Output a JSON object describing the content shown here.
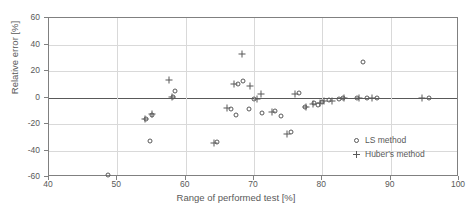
{
  "chart_data": {
    "type": "scatter",
    "title": "",
    "xlabel": "Range of performed test [%]",
    "ylabel": "Relative error [%]",
    "xlim": [
      40,
      100
    ],
    "ylim": [
      -60,
      60
    ],
    "xticks": [
      40,
      50,
      60,
      70,
      80,
      90,
      100
    ],
    "yticks": [
      60,
      40,
      20,
      0,
      -20,
      -40,
      -60
    ],
    "grid": true,
    "legend_position": "inside-bottom-right",
    "series": [
      {
        "name": "LS method",
        "marker": "circle",
        "points": [
          [
            48.6,
            -58.5
          ],
          [
            54.2,
            -16.5
          ],
          [
            55.0,
            -13.5
          ],
          [
            54.8,
            -33.0
          ],
          [
            58.4,
            5.0
          ],
          [
            58.2,
            0.5
          ],
          [
            64.6,
            -33.5
          ],
          [
            66.6,
            -8.5
          ],
          [
            67.6,
            10.5
          ],
          [
            68.4,
            12.5
          ],
          [
            67.4,
            -13.0
          ],
          [
            69.2,
            -9.0
          ],
          [
            70.0,
            -1.0
          ],
          [
            71.2,
            -11.5
          ],
          [
            73.0,
            -10.0
          ],
          [
            74.0,
            -14.0
          ],
          [
            75.4,
            -26.0
          ],
          [
            76.6,
            3.5
          ],
          [
            77.4,
            -7.0
          ],
          [
            78.8,
            -4.5
          ],
          [
            79.4,
            -5.5
          ],
          [
            80.0,
            -3.5
          ],
          [
            81.0,
            -2.0
          ],
          [
            82.4,
            -1.5
          ],
          [
            83.0,
            -0.5
          ],
          [
            85.0,
            0.0
          ],
          [
            86.0,
            27.0
          ],
          [
            86.6,
            0.0
          ],
          [
            88.0,
            0.0
          ],
          [
            95.6,
            0.0
          ]
        ]
      },
      {
        "name": "Huber's method",
        "marker": "plus",
        "points": [
          [
            54.0,
            -16.0
          ],
          [
            55.0,
            -12.5
          ],
          [
            57.6,
            13.5
          ],
          [
            58.0,
            0.5
          ],
          [
            64.2,
            -34.0
          ],
          [
            66.0,
            -8.0
          ],
          [
            67.0,
            10.0
          ],
          [
            68.2,
            33.0
          ],
          [
            69.4,
            9.0
          ],
          [
            70.4,
            -1.5
          ],
          [
            71.0,
            3.0
          ],
          [
            72.6,
            -11.0
          ],
          [
            74.8,
            -27.5
          ],
          [
            76.0,
            2.5
          ],
          [
            77.6,
            -7.5
          ],
          [
            78.6,
            -5.0
          ],
          [
            79.6,
            -4.0
          ],
          [
            80.2,
            -3.0
          ],
          [
            81.4,
            -2.5
          ],
          [
            83.2,
            0.0
          ],
          [
            85.4,
            0.0
          ],
          [
            87.2,
            0.0
          ],
          [
            94.6,
            0.0
          ]
        ]
      }
    ]
  },
  "legend": {
    "items": [
      {
        "label": "LS method",
        "marker": "circle"
      },
      {
        "label": "Huber's method",
        "marker": "plus"
      }
    ]
  }
}
